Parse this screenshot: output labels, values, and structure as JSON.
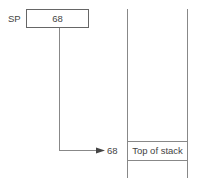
{
  "register": {
    "label": "SP",
    "value": "68"
  },
  "pointer": {
    "address": "68"
  },
  "stack": {
    "cells": [
      {
        "label": "Top of stack",
        "address": "68"
      }
    ]
  },
  "colors": {
    "line": "#888888",
    "box_border": "#666666",
    "text": "#444444"
  }
}
